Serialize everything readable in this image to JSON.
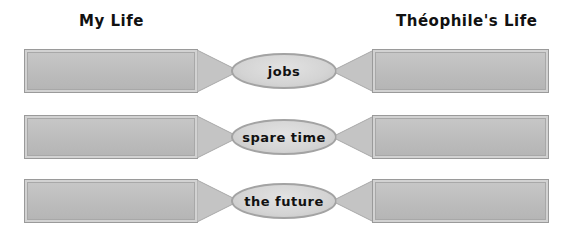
{
  "headings": {
    "left": "My Life",
    "right": "Théophile's Life"
  },
  "rows": [
    {
      "topic": "jobs",
      "left_value": "",
      "right_value": ""
    },
    {
      "topic": "spare time",
      "left_value": "",
      "right_value": ""
    },
    {
      "topic": "the future",
      "left_value": "",
      "right_value": ""
    }
  ],
  "colors": {
    "box_fill": "#bdbdbd",
    "box_border": "#9a9a9a",
    "oval_fill": "#d4d4d4",
    "text": "#111111"
  }
}
